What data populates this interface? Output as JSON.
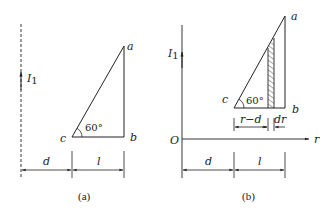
{
  "figure_a": {
    "caption": "(a)",
    "current_label": "I",
    "current_sub": "1",
    "vertices": {
      "a": "a",
      "b": "b",
      "c": "c"
    },
    "angle": "60°",
    "dim_d": "d",
    "dim_l": "l"
  },
  "figure_b": {
    "caption": "(b)",
    "current_label": "I",
    "current_sub": "1",
    "origin": "O",
    "axis_r": "r",
    "vertices": {
      "a": "a",
      "b": "b",
      "c": "c"
    },
    "angle": "60°",
    "dim_r_minus_d": "r−d",
    "dim_dr": "dr",
    "dim_d": "d",
    "dim_l": "l"
  },
  "colors": {
    "line": "#222222",
    "background": "#ffffff"
  }
}
